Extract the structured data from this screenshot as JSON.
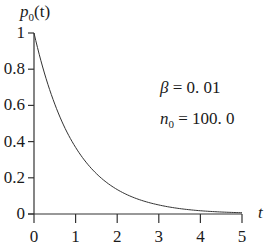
{
  "chart_data": {
    "type": "line",
    "title": "",
    "xlabel": "t",
    "ylabel": "p_0(t)",
    "xlim": [
      0,
      5
    ],
    "ylim": [
      0,
      1
    ],
    "grid": false,
    "x_ticks": [
      "0",
      "1",
      "2",
      "3",
      "4",
      "5"
    ],
    "y_ticks": [
      "0",
      "0.2",
      "0.4",
      "0.6",
      "0.8",
      "1"
    ],
    "series": [
      {
        "name": "p_0(t) = exp(-beta*n0*t)",
        "x": [
          0,
          0.25,
          0.5,
          0.75,
          1,
          1.5,
          2,
          2.5,
          3,
          3.5,
          4,
          4.5,
          5
        ],
        "values": [
          1,
          0.779,
          0.607,
          0.472,
          0.368,
          0.223,
          0.135,
          0.082,
          0.05,
          0.03,
          0.018,
          0.011,
          0.007
        ]
      }
    ],
    "annotations": [
      {
        "text": "β = 0. 01",
        "symbol": "β",
        "value": "0. 01"
      },
      {
        "text": "n0 = 100. 0",
        "symbol": "n",
        "subscript": "0",
        "value": "100. 0"
      }
    ]
  },
  "labels": {
    "ylabel_main": "p",
    "ylabel_sub": "0",
    "ylabel_arg": "(t)",
    "xlabel": "t",
    "beta_sym": "β",
    "beta_eq": " = 0. 01",
    "n_sym": "n",
    "n_sub": "0",
    "n_eq": " = 100. 0"
  },
  "colors": {
    "axis": "#333333",
    "curve": "#333333",
    "text": "#1a1a1a"
  }
}
